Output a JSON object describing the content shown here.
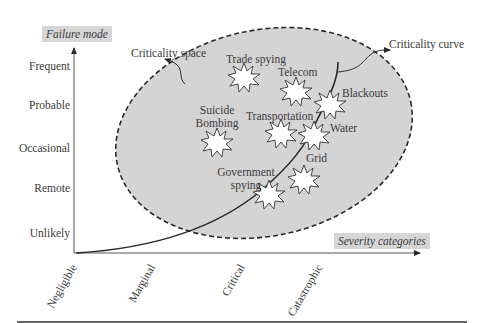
{
  "y_axis": {
    "title": "Failure mode",
    "levels": [
      "Frequent",
      "Probable",
      "Occasional",
      "Remote",
      "Unlikely"
    ]
  },
  "x_axis": {
    "title": "Severity categories",
    "levels": [
      "Negligible",
      "Marginal",
      "Critical",
      "Catastrophic"
    ]
  },
  "annotations": {
    "criticality_space": "Criticality space",
    "criticality_curve": "Criticality curve"
  },
  "events": [
    {
      "id": "trade-spying",
      "label": "Trade spying"
    },
    {
      "id": "telecom",
      "label": "Telecom"
    },
    {
      "id": "blackouts",
      "label": "Blackouts"
    },
    {
      "id": "suicide-bombing",
      "label_line1": "Suicide",
      "label_line2": "Bombing"
    },
    {
      "id": "transportation",
      "label": "Transportation"
    },
    {
      "id": "water",
      "label": "Water"
    },
    {
      "id": "grid",
      "label": "Grid"
    },
    {
      "id": "government-spying",
      "label_line1": "Government",
      "label_line2": "spying"
    }
  ],
  "colors": {
    "space_fill": "#d4d4d4",
    "axis_title_bg": "#d6d6d6",
    "line": "#2a2a2a",
    "text": "#3a3a3a"
  }
}
